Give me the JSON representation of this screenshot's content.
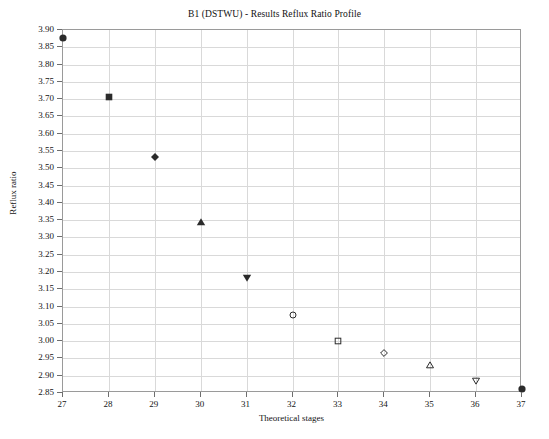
{
  "chart_data": {
    "type": "scatter",
    "title": "B1 (DSTWU) - Results Reflux Ratio Profile",
    "xlabel": "Theoretical stages",
    "ylabel": "Reflux ratio",
    "xlim": [
      27,
      37
    ],
    "ylim": [
      2.85,
      3.9
    ],
    "grid": true,
    "legend": false,
    "x": [
      27,
      28,
      29,
      30,
      31,
      32,
      33,
      34,
      35,
      36,
      37
    ],
    "values": [
      3.878,
      3.705,
      3.532,
      3.345,
      3.182,
      3.075,
      3.0,
      2.965,
      2.93,
      2.885,
      2.862
    ],
    "markers": [
      "filled-circle",
      "filled-square",
      "filled-diamond",
      "filled-triangle-up",
      "filled-triangle-down",
      "open-circle",
      "open-square",
      "open-diamond",
      "open-triangle-up",
      "open-triangle-down",
      "filled-circle"
    ],
    "marker_color": "#2b2b2b",
    "xticks": [
      "27",
      "28",
      "29",
      "30",
      "31",
      "32",
      "33",
      "34",
      "35",
      "36",
      "37"
    ],
    "yticks": [
      "3.90",
      "3.85",
      "3.80",
      "3.75",
      "3.70",
      "3.65",
      "3.60",
      "3.55",
      "3.50",
      "3.45",
      "3.40",
      "3.35",
      "3.30",
      "3.25",
      "3.20",
      "3.15",
      "3.10",
      "3.05",
      "3.00",
      "2.95",
      "2.90",
      "2.85"
    ],
    "ytick_values": [
      3.9,
      3.85,
      3.8,
      3.75,
      3.7,
      3.65,
      3.6,
      3.55,
      3.5,
      3.45,
      3.4,
      3.35,
      3.3,
      3.25,
      3.2,
      3.15,
      3.1,
      3.05,
      3.0,
      2.95,
      2.9,
      2.85
    ],
    "colors": {
      "grid": "#d9d9d9",
      "frame": "#9a9a9a",
      "text": "#141414",
      "background": "#ffffff"
    }
  }
}
